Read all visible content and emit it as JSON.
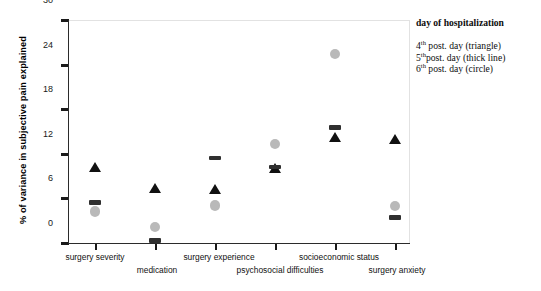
{
  "chart_data": {
    "type": "scatter",
    "title": "",
    "xlabel": "",
    "ylabel": "% of variance in subjective pain explained",
    "ylim": [
      0,
      30
    ],
    "yticks": [
      0,
      6,
      12,
      18,
      24,
      30
    ],
    "grid": false,
    "categories": [
      "surgery severity",
      "medication",
      "surgery experience",
      "psychosocial difficulties",
      "socioeconomic status",
      "surgery anxiety"
    ],
    "legend_position": "right",
    "series": [
      {
        "name": "4th post. day (triangle)",
        "marker": "triangle",
        "color": "#111111",
        "values": [
          10.2,
          7.3,
          7.2,
          10.1,
          14.2,
          14.0
        ]
      },
      {
        "name": "5th post. day (thick line)",
        "marker": "thick-line",
        "color": "#2f2f2f",
        "values": [
          5.4,
          0.3,
          11.4,
          10.2,
          15.5,
          3.4
        ]
      },
      {
        "name": "6th post. day (circle)",
        "marker": "circle",
        "color": "#b9b9b9",
        "values": [
          4.2,
          2.1,
          5.0,
          13.3,
          25.4,
          4.9
        ]
      }
    ]
  },
  "legend": {
    "title": "day of hospitalization",
    "items": [
      {
        "ordinal": "4",
        "sup": "th",
        "text": " post. day (triangle)"
      },
      {
        "ordinal": "5",
        "sup": "th",
        "text": "post. day (thick line)"
      },
      {
        "ordinal": "6",
        "sup": "th",
        "text": " post. day (circle)"
      }
    ]
  },
  "axis": {
    "ylabels": [
      "30",
      "24",
      "18",
      "12",
      "6",
      "0"
    ],
    "ytitle": "% of variance in subjective pain explained"
  }
}
